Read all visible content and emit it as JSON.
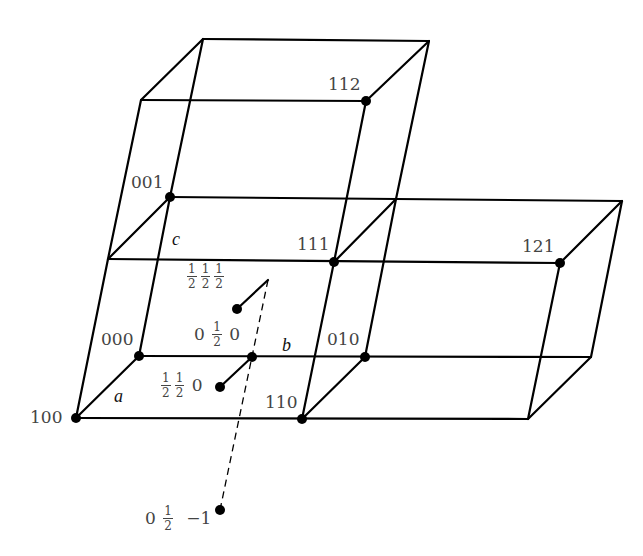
{
  "diagram": {
    "title": "",
    "type": "crystal lattice unit cells (triclinic) with lattice points",
    "axes": {
      "a": "a",
      "b": "b",
      "c": "c"
    },
    "lattice_points": [
      {
        "id": "100",
        "label": "100"
      },
      {
        "id": "110",
        "label": "110"
      },
      {
        "id": "000",
        "label": "000"
      },
      {
        "id": "010",
        "label": "010"
      },
      {
        "id": "001",
        "label": "001"
      },
      {
        "id": "111",
        "label": "111"
      },
      {
        "id": "112",
        "label": "112"
      },
      {
        "id": "121",
        "label": "121"
      }
    ],
    "fractional_points": [
      {
        "id": "half_half_half",
        "parts": [
          "1/2",
          "1/2",
          "1/2"
        ]
      },
      {
        "id": "zero_half_zero",
        "parts": [
          "0",
          "1/2",
          "0"
        ]
      },
      {
        "id": "half_half_zero",
        "parts": [
          "1/2",
          "1/2",
          "0"
        ]
      },
      {
        "id": "zero_half_minus_one",
        "parts": [
          "0",
          "1/2",
          "−1"
        ]
      }
    ],
    "frac": {
      "num": "1",
      "den": "2",
      "zero": "0",
      "minus_one": "−1"
    }
  }
}
